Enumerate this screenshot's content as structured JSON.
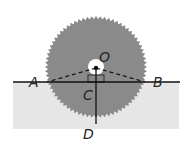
{
  "diagram": {
    "type": "geometry",
    "labels": {
      "A": "A",
      "B": "B",
      "O": "O",
      "C": "C",
      "D": "D"
    },
    "colors": {
      "blade": "#8a8a8a",
      "board": "#e6e6e6",
      "line": "#111111",
      "hub": "#ffffff"
    },
    "segments": [
      {
        "from": "O",
        "to": "A",
        "style": "dashed"
      },
      {
        "from": "O",
        "to": "B",
        "style": "dashed"
      },
      {
        "from": "A",
        "to": "B",
        "style": "solid"
      },
      {
        "from": "O",
        "to": "D",
        "style": "solid"
      }
    ],
    "right_angle_at": "C"
  }
}
